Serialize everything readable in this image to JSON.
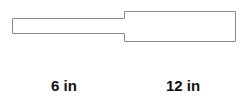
{
  "diagram": {
    "stroke_color": "#8a8a8a",
    "fill_color": "#ffffff",
    "sections": [
      {
        "name": "narrow-section",
        "label": "6 in"
      },
      {
        "name": "wide-section",
        "label": "12 in"
      }
    ]
  }
}
